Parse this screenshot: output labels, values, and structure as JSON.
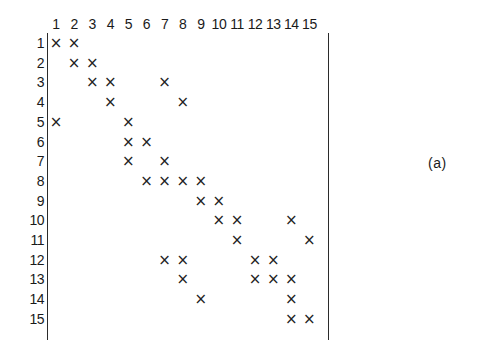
{
  "figure": {
    "panel_label": "(a)",
    "mark_glyph": "×",
    "ink_color": "#222222",
    "background_color": "#ffffff",
    "axis_color": "#2b2b2b"
  },
  "chart_data": {
    "type": "heatmap",
    "title": "",
    "subtitle": "",
    "xlabel": "",
    "ylabel": "",
    "grid": false,
    "legend": null,
    "annotations": [
      "(a)"
    ],
    "axis_ranges": {
      "x": [
        1,
        15
      ],
      "y": [
        1,
        15
      ]
    },
    "x_tick_labels": [
      "1",
      "2",
      "3",
      "4",
      "5",
      "6",
      "7",
      "8",
      "9",
      "10",
      "11",
      "12",
      "13",
      "14",
      "15"
    ],
    "y_tick_labels": [
      "1",
      "2",
      "3",
      "4",
      "5",
      "6",
      "7",
      "8",
      "9",
      "10",
      "11",
      "12",
      "13",
      "14",
      "15"
    ],
    "columns": [
      "1",
      "2",
      "3",
      "4",
      "5",
      "6",
      "7",
      "8",
      "9",
      "10",
      "11",
      "12",
      "13",
      "14",
      "15"
    ],
    "rows": [
      "1",
      "2",
      "3",
      "4",
      "5",
      "6",
      "7",
      "8",
      "9",
      "10",
      "11",
      "12",
      "13",
      "14",
      "15"
    ],
    "marked_cells": [
      {
        "row": 1,
        "cols": [
          1,
          2
        ]
      },
      {
        "row": 2,
        "cols": [
          2,
          3
        ]
      },
      {
        "row": 3,
        "cols": [
          3,
          4,
          7
        ]
      },
      {
        "row": 4,
        "cols": [
          4,
          8
        ]
      },
      {
        "row": 5,
        "cols": [
          1,
          5
        ]
      },
      {
        "row": 6,
        "cols": [
          5,
          6
        ]
      },
      {
        "row": 7,
        "cols": [
          5,
          7
        ]
      },
      {
        "row": 8,
        "cols": [
          6,
          7,
          8,
          9
        ]
      },
      {
        "row": 9,
        "cols": [
          9,
          10
        ]
      },
      {
        "row": 10,
        "cols": [
          10,
          11,
          14
        ]
      },
      {
        "row": 11,
        "cols": [
          11,
          15
        ]
      },
      {
        "row": 12,
        "cols": [
          7,
          8,
          12,
          13
        ]
      },
      {
        "row": 13,
        "cols": [
          8,
          12,
          13,
          14
        ]
      },
      {
        "row": 14,
        "cols": [
          9,
          14
        ]
      },
      {
        "row": 15,
        "cols": [
          14,
          15
        ]
      }
    ],
    "matrix": [
      [
        1,
        1,
        0,
        0,
        0,
        0,
        0,
        0,
        0,
        0,
        0,
        0,
        0,
        0,
        0
      ],
      [
        0,
        1,
        1,
        0,
        0,
        0,
        0,
        0,
        0,
        0,
        0,
        0,
        0,
        0,
        0
      ],
      [
        0,
        0,
        1,
        1,
        0,
        0,
        1,
        0,
        0,
        0,
        0,
        0,
        0,
        0,
        0
      ],
      [
        0,
        0,
        0,
        1,
        0,
        0,
        0,
        1,
        0,
        0,
        0,
        0,
        0,
        0,
        0
      ],
      [
        1,
        0,
        0,
        0,
        1,
        0,
        0,
        0,
        0,
        0,
        0,
        0,
        0,
        0,
        0
      ],
      [
        0,
        0,
        0,
        0,
        1,
        1,
        0,
        0,
        0,
        0,
        0,
        0,
        0,
        0,
        0
      ],
      [
        0,
        0,
        0,
        0,
        1,
        0,
        1,
        0,
        0,
        0,
        0,
        0,
        0,
        0,
        0
      ],
      [
        0,
        0,
        0,
        0,
        0,
        1,
        1,
        1,
        1,
        0,
        0,
        0,
        0,
        0,
        0
      ],
      [
        0,
        0,
        0,
        0,
        0,
        0,
        0,
        0,
        1,
        1,
        0,
        0,
        0,
        0,
        0
      ],
      [
        0,
        0,
        0,
        0,
        0,
        0,
        0,
        0,
        0,
        1,
        1,
        0,
        0,
        1,
        0
      ],
      [
        0,
        0,
        0,
        0,
        0,
        0,
        0,
        0,
        0,
        0,
        1,
        0,
        0,
        0,
        1
      ],
      [
        0,
        0,
        0,
        0,
        0,
        0,
        1,
        1,
        0,
        0,
        0,
        1,
        1,
        0,
        0
      ],
      [
        0,
        0,
        0,
        0,
        0,
        0,
        0,
        1,
        0,
        0,
        0,
        1,
        1,
        1,
        0
      ],
      [
        0,
        0,
        0,
        0,
        0,
        0,
        0,
        0,
        1,
        0,
        0,
        0,
        0,
        1,
        0
      ],
      [
        0,
        0,
        0,
        0,
        0,
        0,
        0,
        0,
        0,
        0,
        0,
        0,
        0,
        1,
        1
      ]
    ],
    "total_marks": 37
  }
}
